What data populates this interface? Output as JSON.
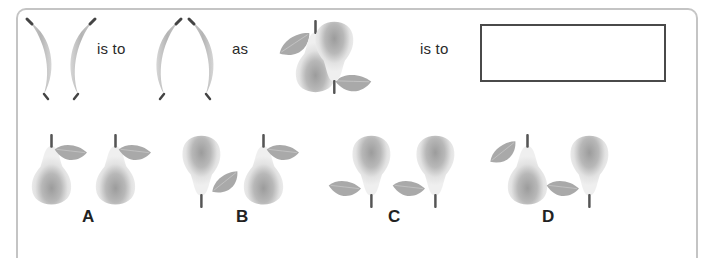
{
  "question": {
    "phrase_1": "is to",
    "phrase_2": "as",
    "phrase_3": "is to",
    "answer_box_value": "",
    "items": [
      {
        "name": "bananas-facing-outward",
        "description": "two bananas curved back-to-back ) ("
      },
      {
        "name": "bananas-facing-inward",
        "description": "two bananas curved facing each other ( )"
      },
      {
        "name": "pear-pair",
        "description": "upright pear with leaf on left, then inverted pear with leaf on left"
      }
    ]
  },
  "options": [
    {
      "label": "A",
      "pears": [
        "upright-leaf-right",
        "upright-leaf-right"
      ]
    },
    {
      "label": "B",
      "pears": [
        "inverted-leaf-right",
        "upright-leaf-right"
      ]
    },
    {
      "label": "C",
      "pears": [
        "inverted-leaf-left",
        "inverted-leaf-left"
      ]
    },
    {
      "label": "D",
      "pears": [
        "upright-leaf-left",
        "inverted-leaf-left"
      ]
    }
  ],
  "colors": {
    "frame": "#c4c4c4",
    "fruit_light": "#e8e8e8",
    "fruit_dark": "#9a9a9a",
    "leaf": "#a8a8a8",
    "stem": "#555555",
    "box_border": "#4a4a4a"
  }
}
